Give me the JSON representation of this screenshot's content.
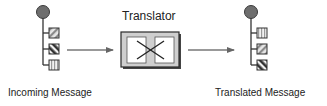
{
  "diagram": {
    "translator_label": "Translator",
    "incoming_label": "Incoming Message",
    "translated_label": "Translated Message",
    "incoming_message": {
      "root": "message-root-icon",
      "parts": [
        "light-diagonal-stripes",
        "dark-diagonal-stripes",
        "vertical-stripes"
      ]
    },
    "translated_message": {
      "root": "message-root-icon",
      "parts": [
        "vertical-stripes",
        "light-diagonal-stripes",
        "dark-diagonal-stripes"
      ]
    },
    "colors": {
      "circle": "#6e6e6e",
      "line": "#333333",
      "arrow": "#777777",
      "box_fill": "#cfcfcf",
      "panel_fill": "#ffffff"
    }
  }
}
